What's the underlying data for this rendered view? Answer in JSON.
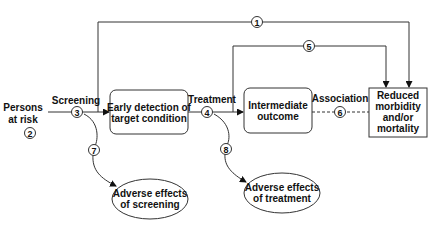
{
  "diagram": {
    "nodes": {
      "persons_at_risk": {
        "line1": "Persons",
        "line2": "at risk",
        "number": "2"
      },
      "early_detection": {
        "line1": "Early detection of",
        "line2": "target condition"
      },
      "intermediate_outcome": {
        "line1": "Intermediate",
        "line2": "outcome"
      },
      "reduced_morbidity": {
        "line1": "Reduced",
        "line2": "morbidity",
        "line3": "and/or",
        "line4": "mortality"
      },
      "adverse_screening": {
        "line1": "Adverse effects",
        "line2": "of screening"
      },
      "adverse_treatment": {
        "line1": "Adverse effects",
        "line2": "of treatment"
      }
    },
    "edge_labels": {
      "screening": "Screening",
      "treatment": "Treatment",
      "association": "Association"
    },
    "key_questions": {
      "kq1": "1",
      "kq3": "3",
      "kq4": "4",
      "kq5": "5",
      "kq6": "6",
      "kq7": "7",
      "kq8": "8"
    },
    "colors": {
      "stroke": "#333333",
      "text": "#111111",
      "background": "#ffffff"
    }
  }
}
